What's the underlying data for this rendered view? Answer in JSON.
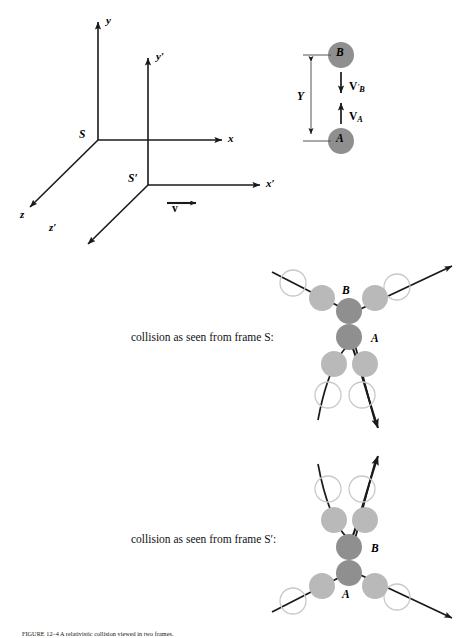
{
  "figure": {
    "axes_S": {
      "origin_label": "S",
      "x_label": "x",
      "y_label": "y",
      "z_label": "z"
    },
    "axes_Sprime": {
      "origin_label": "S′",
      "x_label": "x′",
      "y_label": "y′",
      "z_label": "z′",
      "velocity_label": "v"
    },
    "setup": {
      "ball_B_label": "B",
      "ball_A_label": "A",
      "separation_label": "Y",
      "velocity_B_label": "V",
      "velocity_B_sub": "B",
      "velocity_B_prime": "′",
      "velocity_A_label": "V",
      "velocity_A_sub": "A"
    },
    "panel_S": {
      "caption": "collision as seen from frame S:",
      "ball_B_label": "B",
      "ball_A_label": "A"
    },
    "panel_Sprime": {
      "caption": "collision as seen from frame S′:",
      "ball_B_label": "B",
      "ball_A_label": "A"
    },
    "figure_caption": "FIGURE 12–4   A relativistic collision viewed in two frames.",
    "colors": {
      "ink": "#1a1a1a",
      "ball_dark": "#8f8f8f",
      "ball_light": "#b9b9b9",
      "ball_outline": "#c9c9c9"
    }
  }
}
